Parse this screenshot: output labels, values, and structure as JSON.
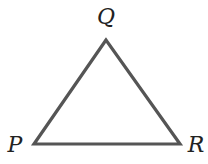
{
  "diagram": {
    "type": "triangle",
    "vertices": [
      {
        "name": "Q",
        "x": 106,
        "y": 40,
        "label_x": 106,
        "label_y": 24
      },
      {
        "name": "P",
        "x": 34,
        "y": 144,
        "label_x": 15,
        "label_y": 152
      },
      {
        "name": "R",
        "x": 180,
        "y": 144,
        "label_x": 196,
        "label_y": 152
      }
    ],
    "stroke_color": "#555555",
    "label_color": "#222222"
  }
}
